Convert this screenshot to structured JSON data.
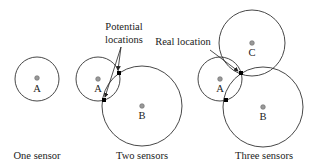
{
  "diagram": {
    "panels": [
      {
        "caption": "One sensor",
        "sensors": [
          {
            "label": "A",
            "cx": 37,
            "cy": 79,
            "r": 22
          }
        ]
      },
      {
        "caption": "Two sensors",
        "sensors": [
          {
            "label": "A",
            "cx": 98,
            "cy": 79,
            "r": 22
          },
          {
            "label": "B",
            "cx": 142,
            "cy": 106,
            "r": 40
          }
        ],
        "intersections": [
          {
            "x": 119,
            "y": 73
          },
          {
            "x": 104,
            "y": 100
          }
        ],
        "annotation": {
          "line1": "Potential",
          "line2": "locations"
        }
      },
      {
        "caption": "Three sensors",
        "sensors": [
          {
            "label": "A",
            "cx": 220,
            "cy": 79,
            "r": 22
          },
          {
            "label": "B",
            "cx": 263,
            "cy": 107,
            "r": 40
          },
          {
            "label": "C",
            "cx": 252,
            "cy": 43,
            "r": 33
          }
        ],
        "intersections": [
          {
            "x": 241,
            "y": 73
          },
          {
            "x": 226,
            "y": 100
          }
        ],
        "annotation": {
          "text": "Real location"
        }
      }
    ],
    "colors": {
      "circle_stroke": "#333333",
      "sensor_dot": "#999999",
      "intersection_point": "#000000"
    }
  }
}
